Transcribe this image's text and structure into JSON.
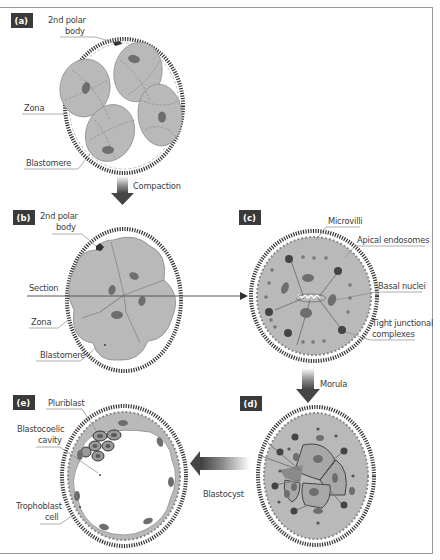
{
  "figure": {
    "panels": [
      {
        "id": "a",
        "tag": "(a)",
        "labels": {
          "polar_body": [
            "2nd polar",
            "body"
          ],
          "zona": "Zona",
          "blastomere": "Blastomere"
        }
      },
      {
        "id": "b",
        "tag": "(b)",
        "labels": {
          "polar_body": [
            "2nd polar",
            "body"
          ],
          "section": "Section",
          "zona": "Zona",
          "blastomere": "Blastomere"
        }
      },
      {
        "id": "c",
        "tag": "(c)",
        "labels": {
          "microvilli": "Microvilli",
          "apical_endosomes": "Apical endosomes",
          "basal_nuclei": "Basal nuclei",
          "tight_junctional": [
            "Tight junctional",
            "complexes"
          ]
        }
      },
      {
        "id": "d",
        "tag": "(d)",
        "labels": {}
      },
      {
        "id": "e",
        "tag": "(e)",
        "labels": {
          "pluriblast": "Pluriblast",
          "blastocoelic_cavity": [
            "Blastocoelic",
            "cavity"
          ],
          "trophoblast_cell": [
            "Trophoblast",
            "cell"
          ]
        }
      }
    ],
    "arrows": {
      "compaction": "Compaction",
      "morula": "Morula",
      "blastocyst": "Blastocyst"
    },
    "colors": {
      "cell_fill": "#b9b9b9",
      "nucleus": "#6e6e6e",
      "tag_bg": "#3a3a3a",
      "zona": "#333333",
      "arrow_dark": "#4a4a4a"
    }
  }
}
